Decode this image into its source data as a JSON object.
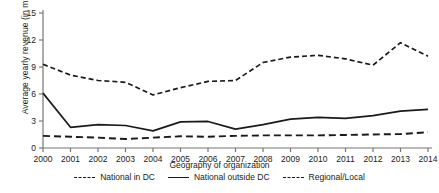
{
  "chart_data": {
    "type": "line",
    "title": "",
    "xlabel": "Geography of organization",
    "ylabel": "Average yearly revenue (in millions)",
    "x": [
      2000,
      2001,
      2002,
      2003,
      2004,
      2005,
      2006,
      2007,
      2008,
      2009,
      2010,
      2011,
      2012,
      2013,
      2014
    ],
    "xticklabels": [
      "2000",
      "2001",
      "2002",
      "2003",
      "2004",
      "2005",
      "2006",
      "2007",
      "2008",
      "2009",
      "2010",
      "2011",
      "2012",
      "2013",
      "2014"
    ],
    "yticklabels": [
      "0",
      "3",
      "6",
      "9",
      "12",
      "15"
    ],
    "yticks": [
      0,
      3,
      6,
      9,
      12,
      15
    ],
    "ylim": [
      0,
      15.8
    ],
    "grid": false,
    "legend_position": "bottom",
    "series": [
      {
        "name": "National in DC",
        "style": "dashed-fine",
        "color": "#1a1a1a",
        "values": [
          9.3,
          8.1,
          7.5,
          7.3,
          5.9,
          6.7,
          7.4,
          7.5,
          9.5,
          10.1,
          10.3,
          9.9,
          9.2,
          11.7,
          10.2
        ]
      },
      {
        "name": "National outside DC",
        "style": "solid",
        "color": "#1a1a1a",
        "values": [
          6.1,
          2.3,
          2.6,
          2.5,
          1.9,
          2.9,
          2.95,
          2.1,
          2.6,
          3.2,
          3.4,
          3.3,
          3.6,
          4.1,
          4.3
        ]
      },
      {
        "name": "Regional/Local",
        "style": "dashed-wide",
        "color": "#1a1a1a",
        "values": [
          1.35,
          1.25,
          1.15,
          1.0,
          1.15,
          1.3,
          1.25,
          1.35,
          1.4,
          1.4,
          1.4,
          1.45,
          1.5,
          1.55,
          1.75
        ]
      }
    ]
  },
  "axis": {
    "x_axis_name": "x-axis",
    "y_axis_name": "y-axis"
  },
  "legend": {
    "items": [
      {
        "label": "National in DC",
        "swatch": "dashed-fine-line-swatch"
      },
      {
        "label": "National outside DC",
        "swatch": "solid-line-swatch"
      },
      {
        "label": "Regional/Local",
        "swatch": "dashed-wide-line-swatch"
      }
    ]
  }
}
